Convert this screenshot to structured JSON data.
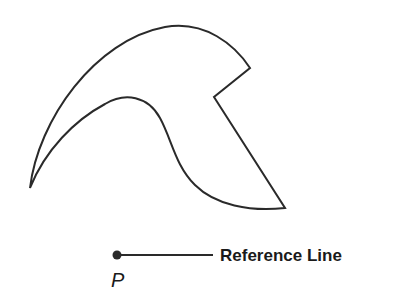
{
  "diagram": {
    "shape": {
      "description": "Closed curved region shaped like a hook/beak",
      "stroke_color": "#2a2a2a",
      "fill_color": "#ffffff"
    },
    "point": {
      "label": "P",
      "color": "#2a2a2a"
    },
    "reference_line": {
      "label": "Reference Line",
      "color": "#2a2a2a"
    }
  }
}
